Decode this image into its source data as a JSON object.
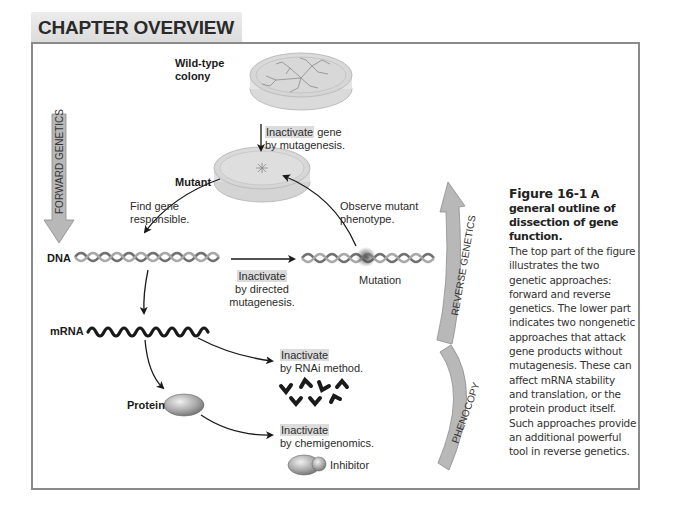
{
  "header": {
    "title": "CHAPTER OVERVIEW Figure"
  },
  "diagram": {
    "wild_type": {
      "line1": "Wild-type",
      "line2": "colony"
    },
    "step_mutagenesis": {
      "highlight": "Inactivate",
      "rest": " gene",
      "line2": "by mutagenesis."
    },
    "mutant": "Mutant",
    "find_gene": {
      "line1": "Find gene",
      "line2": "responsible."
    },
    "observe": {
      "line1": "Observe mutant",
      "line2": "phenotype."
    },
    "dna": "DNA",
    "directed": {
      "highlight": "Inactivate",
      "line2": "by directed",
      "line3": "mutagenesis."
    },
    "mutation": "Mutation",
    "mrna": "mRNA",
    "rnai": {
      "highlight": "Inactivate",
      "line2": "by RNAi method."
    },
    "protein": "Protein",
    "chemigenomics": {
      "highlight": "Inactivate",
      "line2": "by chemigenomics."
    },
    "inhibitor": "Inhibitor",
    "forward_genetics": "FORWARD GENETICS",
    "reverse_genetics": "REVERSE GENETICS",
    "phenocopy": "PHENOCOPY"
  },
  "caption": {
    "figure_number": "Figure 16-1",
    "title": " A general outline of dissection of gene function.",
    "body": "The top part of the figure illustrates the two genetic approaches: forward and reverse genetics. The lower part indicates two nongenetic approaches that attack gene products without mutagenesis. These can affect mRNA stability and translation, or the protein product itself. Such approaches provide an additional powerful tool in reverse genetics."
  },
  "colors": {
    "frame_border": "#8a8a8a",
    "tab_bg": "#e2e2e2",
    "arrow_fill": "#b8b8b8",
    "highlight_bg": "#dcdcdc"
  }
}
